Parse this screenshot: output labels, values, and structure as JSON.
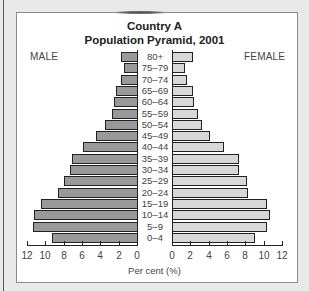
{
  "chart_data": {
    "type": "bar",
    "subtype": "population-pyramid",
    "title": "Country A",
    "subtitle": "Population Pyramid, 2001",
    "xlabel": "Per cent (%)",
    "ylabel": "",
    "legend": [
      "MALE",
      "FEMALE"
    ],
    "categories": [
      "80+",
      "75–79",
      "70–74",
      "65–69",
      "60–64",
      "55–59",
      "50–54",
      "45–49",
      "40–44",
      "35–39",
      "30–34",
      "25–29",
      "20–24",
      "15–19",
      "10–14",
      "5–9",
      "0–4"
    ],
    "series": [
      {
        "name": "MALE",
        "color": "#999999",
        "values": [
          1.8,
          1.4,
          1.7,
          2.3,
          2.5,
          2.7,
          3.5,
          4.5,
          5.9,
          7.1,
          7.3,
          8.0,
          8.6,
          10.5,
          11.2,
          11.3,
          9.3
        ]
      },
      {
        "name": "FEMALE",
        "color": "#d8d8d8",
        "values": [
          2.3,
          1.4,
          1.6,
          2.3,
          2.4,
          2.8,
          3.3,
          4.1,
          5.7,
          7.3,
          7.3,
          8.2,
          8.3,
          10.4,
          10.7,
          10.4,
          9.1
        ]
      }
    ],
    "xlim": [
      0,
      12
    ],
    "x_ticks": [
      0,
      2,
      4,
      6,
      8,
      10,
      12
    ],
    "grid": false
  },
  "labels": {
    "title": "Country A",
    "subtitle": "Population Pyramid, 2001",
    "male": "MALE",
    "female": "FEMALE",
    "xlabel": "Per cent (%)"
  }
}
